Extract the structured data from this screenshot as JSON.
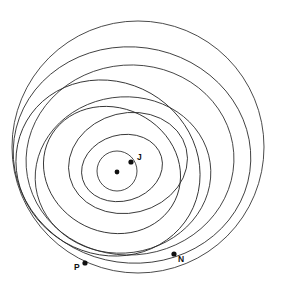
{
  "figure": {
    "kind": "orbit-diagram",
    "title": "",
    "background_color": "#ffffff",
    "stroke_color": "#2b2b2b",
    "marker_color": "#101010",
    "width": 281,
    "height": 294
  },
  "chart_data": {
    "type": "scatter",
    "title": "",
    "xlabel": "",
    "ylabel": "",
    "grid": false,
    "legend": "none",
    "center": {
      "x": 117,
      "y": 172,
      "label": ""
    },
    "orbits": [
      {
        "name": "orbit-1",
        "cx": 117,
        "cy": 171,
        "r": 20,
        "rot": 0
      },
      {
        "name": "orbit-2",
        "cx": 122,
        "cy": 168,
        "rx": 41,
        "ry": 33,
        "rot": -16
      },
      {
        "name": "orbit-3",
        "cx": 128,
        "cy": 163,
        "rx": 60,
        "ry": 50,
        "rot": -14
      },
      {
        "name": "orbit-4",
        "cx": 112,
        "cy": 170,
        "rx": 70,
        "ry": 62,
        "rot": 26
      },
      {
        "name": "orbit-5",
        "cx": 123,
        "cy": 175,
        "rx": 88,
        "ry": 78,
        "rot": -8
      },
      {
        "name": "orbit-6",
        "cx": 108,
        "cy": 168,
        "rx": 94,
        "ry": 86,
        "rot": 30
      },
      {
        "name": "orbit-7",
        "cx": 130,
        "cy": 160,
        "rx": 104,
        "ry": 95,
        "rot": -4
      },
      {
        "name": "orbit-8",
        "cx": 132,
        "cy": 155,
        "rx": 119,
        "ry": 108,
        "rot": 8
      },
      {
        "name": "orbit-9",
        "cx": 138,
        "cy": 147,
        "rx": 126,
        "ry": 126,
        "rot": 0
      }
    ],
    "points": [
      {
        "label": "J",
        "x": 131,
        "y": 162,
        "label_dx": 6,
        "label_dy": -2,
        "r": 2.6
      },
      {
        "label": "N",
        "x": 174,
        "y": 254,
        "label_dx": 4,
        "label_dy": 8,
        "r": 2.6
      },
      {
        "label": "P",
        "x": 85,
        "y": 263,
        "label_dx": -11,
        "label_dy": 7,
        "r": 2.6
      },
      {
        "label": "",
        "x": 117,
        "y": 172,
        "label_dx": 0,
        "label_dy": 0,
        "r": 2.4
      }
    ]
  }
}
